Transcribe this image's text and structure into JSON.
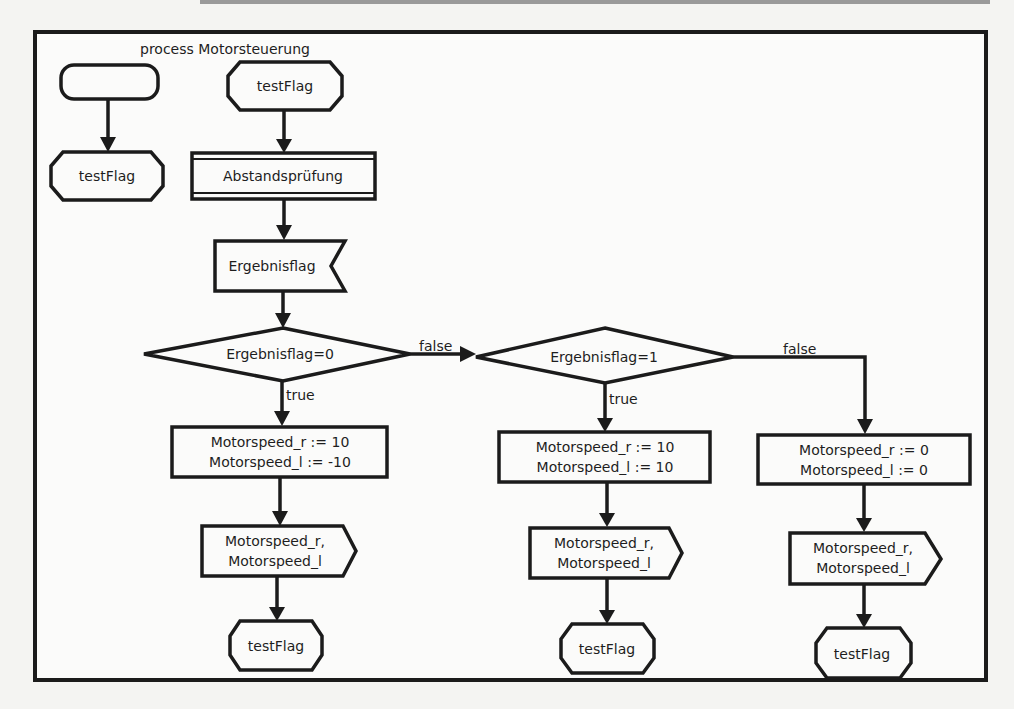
{
  "diagram": {
    "title": "process Motorsteuerung",
    "legend": {
      "start_label": "",
      "end_label": "testFlag"
    },
    "nodes": {
      "start": "testFlag",
      "procedure": "Abstandsprüfung",
      "receive": "Ergebnisflag",
      "decision1": "Ergebnisflag=0",
      "decision2": "Ergebnisflag=1",
      "task_left_l1": "Motorspeed_r := 10",
      "task_left_l2": "Motorspeed_l := -10",
      "task_mid_l1": "Motorspeed_r := 10",
      "task_mid_l2": "Motorspeed_l := 10",
      "task_right_l1": "Motorspeed_r := 0",
      "task_right_l2": "Motorspeed_l := 0",
      "send_left_l1": "Motorspeed_r,",
      "send_left_l2": "Motorspeed_l",
      "send_mid_l1": "Motorspeed_r,",
      "send_mid_l2": "Motorspeed_l",
      "send_right_l1": "Motorspeed_r,",
      "send_right_l2": "Motorspeed_l",
      "end_left": "testFlag",
      "end_mid": "testFlag",
      "end_right": "testFlag"
    },
    "edges": {
      "d1_true": "true",
      "d1_false": "false",
      "d2_true": "true",
      "d2_false": "false"
    }
  }
}
